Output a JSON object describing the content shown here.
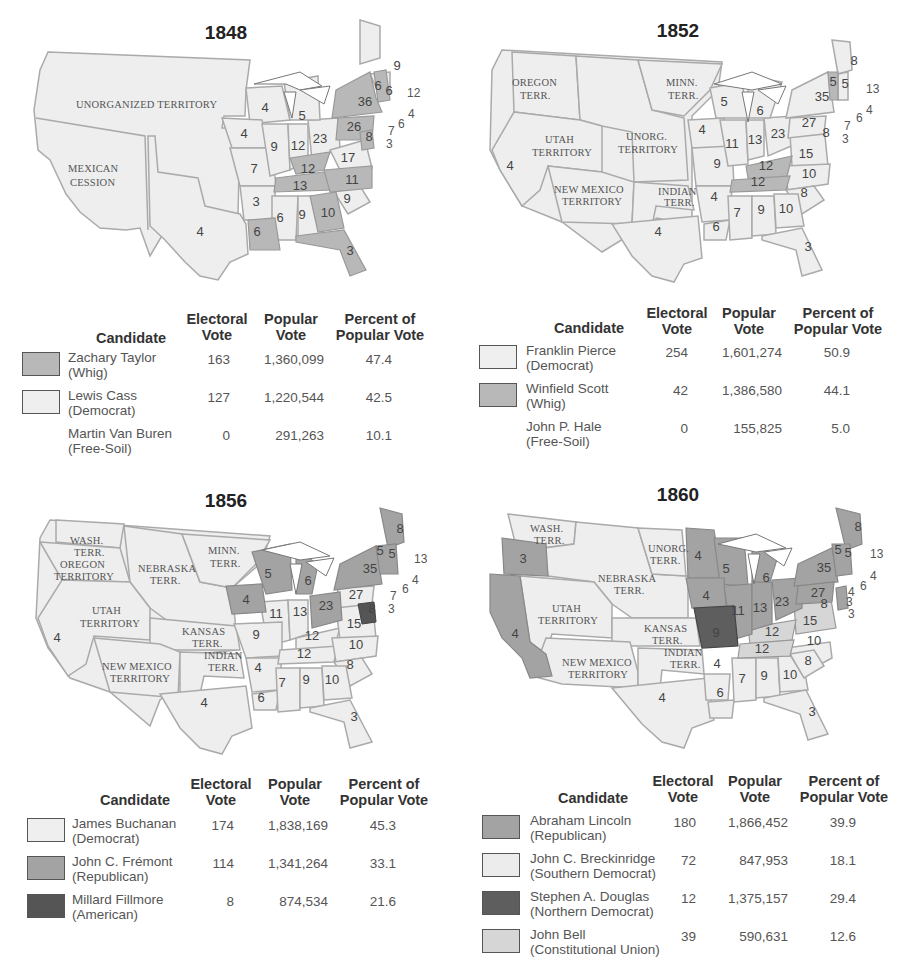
{
  "colors": {
    "light": "#eeeeee",
    "whig": "#b8b8b8",
    "republican": "#a3a3a3",
    "american": "#555555",
    "northern_democrat": "#5e5e5e",
    "southern_democrat": "#ececec",
    "constitutional_union": "#d6d6d6",
    "border": "#aaaaaa"
  },
  "column_headers": {
    "candidate": "Candidate",
    "electoral": [
      "Electoral",
      "Vote"
    ],
    "popular": [
      "Popular",
      "Vote"
    ],
    "percent": [
      "Percent of",
      "Popular Vote"
    ]
  },
  "panels": [
    {
      "year": "1848",
      "territory_labels": [
        "UNORGANIZED TERRITORY",
        "MEXICAN",
        "CESSION"
      ],
      "state_numbers": [
        "9",
        "6",
        "6",
        "12",
        "4",
        "6",
        "36",
        "26",
        "7",
        "3",
        "8",
        "4",
        "5",
        "4",
        "9",
        "12",
        "23",
        "17",
        "12",
        "7",
        "13",
        "11",
        "3",
        "9",
        "6",
        "9",
        "10",
        "6",
        "3",
        "4"
      ],
      "candidates": [
        {
          "name": "Zachary Taylor",
          "party": "(Whig)",
          "electoral": "163",
          "popular": "1,360,099",
          "percent": "47.4",
          "swatch": "#b8b8b8"
        },
        {
          "name": "Lewis Cass",
          "party": "(Democrat)",
          "electoral": "127",
          "popular": "1,220,544",
          "percent": "42.5",
          "swatch": "#efefef"
        },
        {
          "name": "Martin Van Buren",
          "party": "(Free-Soil)",
          "electoral": "0",
          "popular": "291,263",
          "percent": "10.1",
          "swatch": null
        }
      ]
    },
    {
      "year": "1852",
      "territory_labels": [
        "OREGON",
        "TERR.",
        "MINN.",
        "TERR.",
        "UTAH",
        "TERRITORY",
        "UNORG.",
        "TERRITORY",
        "NEW MEXICO",
        "TERRITORY",
        "INDIAN",
        "TERR."
      ],
      "state_numbers": [
        "8",
        "5",
        "5",
        "13",
        "4",
        "6",
        "35",
        "27",
        "7",
        "3",
        "8",
        "5",
        "6",
        "4",
        "11",
        "13",
        "23",
        "15",
        "12",
        "12",
        "10",
        "9",
        "4",
        "8",
        "7",
        "9",
        "10",
        "6",
        "3",
        "4",
        "4"
      ],
      "candidates": [
        {
          "name": "Franklin Pierce",
          "party": "(Democrat)",
          "electoral": "254",
          "popular": "1,601,274",
          "percent": "50.9",
          "swatch": "#efefef"
        },
        {
          "name": "Winfield Scott",
          "party": "(Whig)",
          "electoral": "42",
          "popular": "1,386,580",
          "percent": "44.1",
          "swatch": "#b8b8b8"
        },
        {
          "name": "John P. Hale",
          "party": "(Free-Soil)",
          "electoral": "0",
          "popular": "155,825",
          "percent": "5.0",
          "swatch": null
        }
      ]
    },
    {
      "year": "1856",
      "territory_labels": [
        "WASH.",
        "TERR.",
        "OREGON",
        "TERRITORY",
        "NEBRASKA",
        "TERR.",
        "MINN.",
        "TERR.",
        "UTAH",
        "TERRITORY",
        "KANSAS",
        "TERR.",
        "INDIAN",
        "TERR.",
        "NEW MEXICO",
        "TERRITORY"
      ],
      "state_numbers": [
        "8",
        "5",
        "5",
        "13",
        "4",
        "6",
        "35",
        "27",
        "7",
        "3",
        "8",
        "5",
        "6",
        "4",
        "11",
        "13",
        "23",
        "15",
        "12",
        "9",
        "12",
        "10",
        "4",
        "8",
        "7",
        "9",
        "10",
        "6",
        "3",
        "4",
        "4"
      ],
      "candidates": [
        {
          "name": "James Buchanan",
          "party": "(Democrat)",
          "electoral": "174",
          "popular": "1,838,169",
          "percent": "45.3",
          "swatch": "#efefef"
        },
        {
          "name": "John C. Frémont",
          "party": "(Republican)",
          "electoral": "114",
          "popular": "1,341,264",
          "percent": "33.1",
          "swatch": "#a3a3a3"
        },
        {
          "name": "Millard Fillmore",
          "party": "(American)",
          "electoral": "8",
          "popular": "874,534",
          "percent": "21.6",
          "swatch": "#555555"
        }
      ]
    },
    {
      "year": "1860",
      "territory_labels": [
        "WASH.",
        "TERR.",
        "UNORG.",
        "TERR.",
        "NEBRASKA",
        "TERR.",
        "UTAH",
        "TERRITORY",
        "KANSAS",
        "TERR.",
        "INDIAN",
        "TERR.",
        "NEW MEXICO",
        "TERRITORY"
      ],
      "state_numbers": [
        "8",
        "5",
        "5",
        "13",
        "4",
        "6",
        "4",
        "3",
        "3",
        "35",
        "27",
        "8",
        "3",
        "4",
        "5",
        "6",
        "4",
        "11",
        "13",
        "23",
        "15",
        "12",
        "9",
        "12",
        "10",
        "4",
        "8",
        "7",
        "9",
        "10",
        "6",
        "3",
        "4",
        "4"
      ],
      "candidates": [
        {
          "name": "Abraham Lincoln",
          "party": "(Republican)",
          "electoral": "180",
          "popular": "1,866,452",
          "percent": "39.9",
          "swatch": "#a3a3a3"
        },
        {
          "name": "John C. Breckinridge",
          "party": "(Southern Democrat)",
          "electoral": "72",
          "popular": "847,953",
          "percent": "18.1",
          "swatch": "#ececec"
        },
        {
          "name": "Stephen A. Douglas",
          "party": "(Northern Democrat)",
          "electoral": "12",
          "popular": "1,375,157",
          "percent": "29.4",
          "swatch": "#5e5e5e"
        },
        {
          "name": "John Bell",
          "party": "(Constitutional Union)",
          "electoral": "39",
          "popular": "590,631",
          "percent": "12.6",
          "swatch": "#d6d6d6"
        }
      ]
    }
  ]
}
